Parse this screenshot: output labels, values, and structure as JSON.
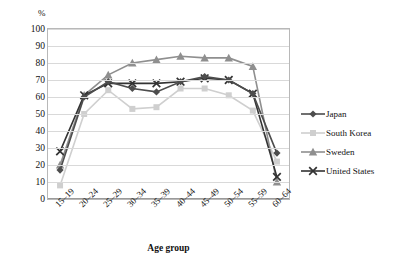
{
  "chart_data": {
    "type": "line",
    "title": "",
    "ylabel": "%",
    "xlabel": "Age group",
    "ylim": [
      0,
      100
    ],
    "ytick_step": 10,
    "grid": true,
    "legend_position": "right",
    "categories": [
      "15–19",
      "20–24",
      "25–29",
      "30–34",
      "35–39",
      "40–44",
      "45–49",
      "50–54",
      "55–59",
      "60–64"
    ],
    "yticks": [
      "0",
      "10",
      "20",
      "30",
      "40",
      "50",
      "60",
      "70",
      "80",
      "90",
      "100"
    ],
    "series": [
      {
        "name": "Japan",
        "color": "#4d4d4d",
        "marker": "diamond",
        "values": [
          17,
          60,
          69,
          65,
          63,
          69,
          72,
          70,
          62,
          27
        ]
      },
      {
        "name": "South Korea",
        "color": "#cfcfcf",
        "marker": "square",
        "values": [
          8,
          50,
          64,
          53,
          54,
          65,
          65,
          61,
          52,
          22
        ]
      },
      {
        "name": "Sweden",
        "color": "#8f8f8f",
        "marker": "triangle",
        "values": [
          20,
          61,
          73,
          80,
          82,
          84,
          83,
          83,
          78,
          10
        ]
      },
      {
        "name": "United States",
        "color": "#333333",
        "marker": "x",
        "values": [
          28,
          61,
          68,
          68,
          68,
          69,
          71,
          70,
          62,
          13
        ]
      }
    ]
  },
  "legend": {
    "items": [
      {
        "label": "Japan"
      },
      {
        "label": "South Korea"
      },
      {
        "label": "Sweden"
      },
      {
        "label": "United States"
      }
    ]
  }
}
